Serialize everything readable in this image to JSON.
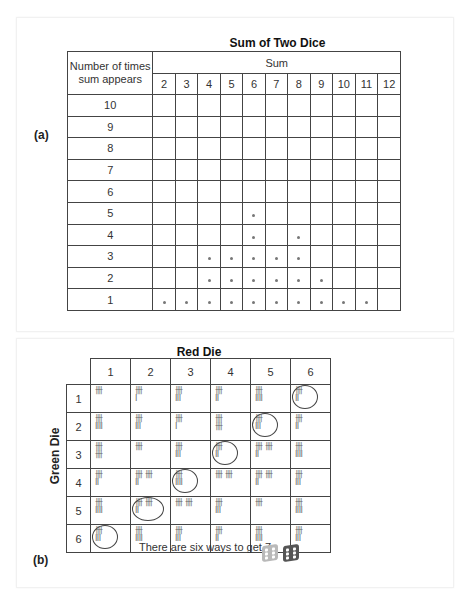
{
  "panel_a": {
    "label": "(a)",
    "title": "Sum of Two Dice",
    "row_header": "Number of times sum appears",
    "row_header_line1": "Number of times",
    "row_header_line2": "sum appears",
    "column_group_header": "Sum",
    "sums": [
      "2",
      "3",
      "4",
      "5",
      "6",
      "7",
      "8",
      "9",
      "10",
      "11",
      "12"
    ],
    "row_counts": [
      "10",
      "9",
      "8",
      "7",
      "6",
      "5",
      "4",
      "3",
      "2",
      "1"
    ],
    "dot_symbol": "•",
    "counts_per_sum": {
      "2": 1,
      "3": 1,
      "4": 3,
      "5": 3,
      "6": 5,
      "7": 3,
      "8": 4,
      "9": 2,
      "10": 1,
      "11": 1,
      "12": 0
    }
  },
  "panel_b": {
    "label": "(b)",
    "title": "Red Die",
    "side_label": "Green Die",
    "columns": [
      "1",
      "2",
      "3",
      "4",
      "5",
      "6"
    ],
    "rows": [
      {
        "label": "1",
        "cells": [
          {
            "tally": "卌",
            "count": 5,
            "circled": false
          },
          {
            "tally": "卌\nI",
            "count": 6,
            "circled": false
          },
          {
            "tally": "卌\nIII",
            "count": 8,
            "circled": false
          },
          {
            "tally": "卌\nII",
            "count": 7,
            "circled": false
          },
          {
            "tally": "卌\nIIII",
            "count": 9,
            "circled": false
          },
          {
            "tally": "卌\nII",
            "count": 7,
            "circled": true
          }
        ]
      },
      {
        "label": "2",
        "cells": [
          {
            "tally": "卌\nIIII",
            "count": 9,
            "circled": false
          },
          {
            "tally": "卌\nIII",
            "count": 8,
            "circled": false
          },
          {
            "tally": "卌\nI",
            "count": 6,
            "circled": false
          },
          {
            "tally": "卌\n卌",
            "count": 10,
            "circled": false
          },
          {
            "tally": "卌\nIII",
            "count": 8,
            "circled": true
          },
          {
            "tally": "卌\nII",
            "count": 7,
            "circled": false
          }
        ]
      },
      {
        "label": "3",
        "cells": [
          {
            "tally": "卌\n卌",
            "count": 10,
            "circled": false
          },
          {
            "tally": "卌",
            "count": 5,
            "circled": false
          },
          {
            "tally": "卌\nIII",
            "count": 8,
            "circled": false
          },
          {
            "tally": "卌\nII",
            "count": 7,
            "circled": true
          },
          {
            "tally": "卌 卌\nII",
            "count": 12,
            "circled": false
          },
          {
            "tally": "卌\nIIII",
            "count": 9,
            "circled": false
          }
        ]
      },
      {
        "label": "4",
        "cells": [
          {
            "tally": "卌\nII",
            "count": 7,
            "circled": false
          },
          {
            "tally": "卌 卌\nII",
            "count": 12,
            "circled": false
          },
          {
            "tally": "卌\nIIII",
            "count": 9,
            "circled": true
          },
          {
            "tally": "卌 卌",
            "count": 10,
            "circled": false
          },
          {
            "tally": "卌 卌\nII",
            "count": 12,
            "circled": false
          },
          {
            "tally": "卌\nIII",
            "count": 8,
            "circled": false
          }
        ]
      },
      {
        "label": "5",
        "cells": [
          {
            "tally": "卌\nIIII",
            "count": 9,
            "circled": false
          },
          {
            "tally": "卌 卌\nII",
            "count": 12,
            "circled": true
          },
          {
            "tally": "卌 卌",
            "count": 10,
            "circled": false
          },
          {
            "tally": "卌\nIII",
            "count": 8,
            "circled": false
          },
          {
            "tally": "卌",
            "count": 5,
            "circled": false
          },
          {
            "tally": "卌\nIIII",
            "count": 9,
            "circled": false
          }
        ]
      },
      {
        "label": "6",
        "cells": [
          {
            "tally": "卌\nIII",
            "count": 8,
            "circled": true
          },
          {
            "tally": "卌\nIIII",
            "count": 9,
            "circled": false
          },
          {
            "tally": "卌\nIII",
            "count": 8,
            "circled": false
          },
          {
            "tally": "卌\nII",
            "count": 7,
            "circled": false
          },
          {
            "tally": "卌\nIIII",
            "count": 9,
            "circled": false
          },
          {
            "tally": "卌\nIII",
            "count": 8,
            "circled": false
          }
        ]
      }
    ],
    "caption": "There are six ways to get 7.",
    "dice_icons": [
      {
        "name": "green-die-icon",
        "color": "#b9b9b9",
        "face": 6
      },
      {
        "name": "red-die-icon",
        "color": "#555555",
        "face": 6
      }
    ]
  }
}
